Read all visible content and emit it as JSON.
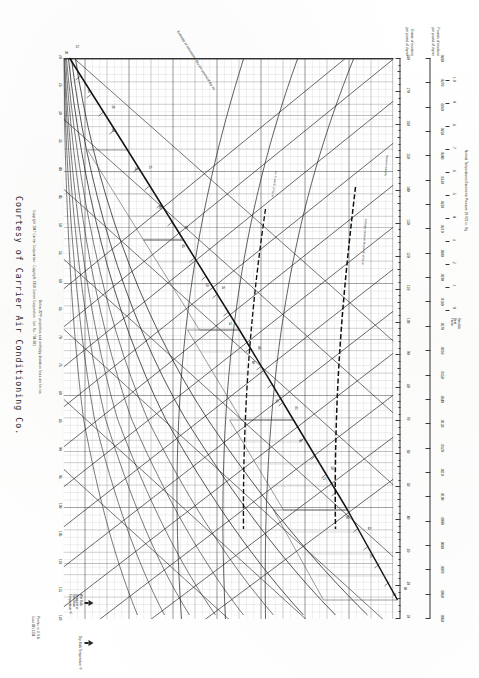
{
  "document": {
    "type": "psychrometric-chart",
    "title": "Psychrometric Chart",
    "courtesy": "Courtesy of Carrier Air Conditioning Co.",
    "copyright": "Copyright 1947 Carrier Corporation · Copyright 1959 Carrier Corporation · Cat. No. 794-001",
    "printed_in": "Printed in U.S.A.",
    "code": "Code 891 1234",
    "note_below_freezing": "Below 32°F properties and enthalpy deviation lines are for ice.",
    "barometric_note": "Normal Temperatures  Barometric Pressure 29.921 in. Hg"
  },
  "axes": {
    "pounds_moisture": {
      "caption_line1": "Pounds of moisture",
      "caption_line2": "per pound of dry air",
      "ticks": [
        ".0050",
        ".0060",
        ".0070",
        ".0080",
        ".0090",
        ".0100",
        ".0110",
        ".0120",
        ".0130",
        ".0140",
        ".0150",
        ".0160",
        ".0170",
        ".0180",
        ".0190",
        ".0200",
        ".0210",
        ".0220",
        ".0230",
        ".0240",
        ".0250",
        ".0260",
        ".0270",
        ".0280"
      ]
    },
    "grains_moisture": {
      "caption_line1": "Grains of moisture",
      "caption_line2": "per pound of dry air",
      "ticks": [
        "180",
        "170",
        "160",
        "150",
        "140",
        "130",
        "120",
        "110",
        "100",
        "90",
        "80",
        "70",
        "60",
        "50",
        "40",
        "30",
        "20",
        "10"
      ]
    },
    "enthalpy": {
      "caption": "Enthalpy at saturation - Btu per pound of dry air",
      "ticks": [
        "15",
        "20",
        "25",
        "30",
        "35",
        "40",
        "45",
        "50",
        "55",
        "60"
      ]
    },
    "dry_bulb": {
      "caption": "Dry Bulb Temperature °F",
      "ticks": [
        "20",
        "25",
        "30",
        "35",
        "40",
        "45",
        "50",
        "55",
        "60",
        "65",
        "70",
        "75",
        "80",
        "85",
        "90",
        "95",
        "100",
        "105",
        "110",
        "115",
        "120"
      ]
    },
    "wet_bulb": {
      "caption_line1": "Wet Bulb,",
      "caption_line2": "Dewpoint or",
      "caption_line3": "Saturation",
      "caption_line4": "Temperature °F",
      "ticks": [
        "20",
        "25",
        "30",
        "35",
        "40",
        "45",
        "50",
        "55",
        "60",
        "65",
        "70",
        "75",
        "80",
        "85",
        "90"
      ]
    },
    "relative_humidity": {
      "caption": "Relative Humidity",
      "curves": [
        "10%",
        "20%",
        "30%",
        "40%",
        "50%",
        "60%",
        "70%",
        "80%",
        "90%"
      ]
    },
    "volume": {
      "caption": "Cu. ft. per lb. of dry air",
      "ticks": [
        "12.5",
        "13.0",
        "13.5",
        "14.0",
        "14.5"
      ]
    },
    "sensible_heat_factor": {
      "caption_line1": "Sensible",
      "caption_line2": "Heat",
      "caption_line3": "Factor",
      "ticks": [
        "1.0",
        ".9",
        ".8",
        ".7",
        ".6",
        ".5",
        ".4",
        ".3",
        ".2",
        ".1",
        "0"
      ]
    },
    "enthalpy_deviation": {
      "caption": "Enthalpy deviation Btu per lb. of dry air",
      "ticks": [
        "-.1",
        "-.2",
        "-.3",
        "-.4",
        "-.5",
        "0",
        ".1",
        ".2",
        ".3"
      ]
    }
  },
  "chart_data": {
    "type": "line",
    "xlabel": "Dry Bulb Temperature °F",
    "ylabel": "Grains of moisture per pound of dry air",
    "xlim": [
      20,
      120
    ],
    "ylim": [
      0,
      185
    ],
    "grid": true,
    "legend_position": "none",
    "x": [
      20,
      25,
      30,
      35,
      40,
      45,
      50,
      55,
      60,
      65,
      70,
      75,
      80,
      85,
      90,
      95,
      100,
      105,
      110,
      115,
      120
    ],
    "series": [
      {
        "name": "Saturation (100% RH)",
        "values": [
          15,
          19,
          24,
          31,
          37,
          45,
          54,
          64,
          77,
          92,
          110,
          132,
          156,
          185,
          220,
          260,
          308,
          364,
          430,
          506,
          596
        ]
      },
      {
        "name": "90% RH",
        "values": [
          13,
          17,
          22,
          28,
          34,
          41,
          49,
          58,
          69,
          83,
          99,
          119,
          141,
          166,
          198,
          234,
          277,
          328,
          387,
          455,
          536
        ]
      },
      {
        "name": "80% RH",
        "values": [
          12,
          15,
          19,
          25,
          30,
          36,
          43,
          51,
          62,
          74,
          88,
          105,
          125,
          148,
          176,
          208,
          246,
          291,
          344,
          405,
          477
        ]
      },
      {
        "name": "70% RH",
        "values": [
          10,
          13,
          17,
          22,
          26,
          32,
          38,
          45,
          54,
          64,
          77,
          92,
          109,
          129,
          154,
          182,
          216,
          255,
          301,
          354,
          417
        ]
      },
      {
        "name": "60% RH",
        "values": [
          9,
          11,
          14,
          19,
          22,
          27,
          32,
          38,
          46,
          55,
          66,
          79,
          94,
          111,
          132,
          156,
          185,
          218,
          258,
          304,
          358
        ]
      },
      {
        "name": "50% RH",
        "values": [
          7,
          9,
          12,
          15,
          19,
          23,
          27,
          32,
          38,
          46,
          55,
          66,
          78,
          92,
          110,
          130,
          154,
          182,
          215,
          253,
          298
        ]
      },
      {
        "name": "40% RH",
        "values": [
          6,
          8,
          10,
          12,
          15,
          18,
          22,
          26,
          31,
          37,
          44,
          53,
          62,
          74,
          88,
          104,
          123,
          146,
          172,
          202,
          238
        ]
      },
      {
        "name": "30% RH",
        "values": [
          4,
          6,
          7,
          9,
          11,
          14,
          16,
          19,
          23,
          28,
          33,
          40,
          47,
          55,
          66,
          78,
          92,
          109,
          129,
          152,
          179
        ]
      },
      {
        "name": "20% RH",
        "values": [
          3,
          4,
          5,
          6,
          7,
          9,
          11,
          13,
          15,
          18,
          22,
          26,
          31,
          37,
          44,
          52,
          62,
          73,
          86,
          101,
          119
        ]
      },
      {
        "name": "10% RH",
        "values": [
          1,
          2,
          2,
          3,
          4,
          5,
          5,
          6,
          8,
          9,
          11,
          13,
          16,
          18,
          22,
          26,
          31,
          36,
          43,
          51,
          60
        ]
      }
    ],
    "wet_bulb_lines_degF": [
      20,
      25,
      30,
      35,
      40,
      45,
      50,
      55,
      60,
      65,
      70,
      75,
      80,
      85,
      90
    ],
    "enthalpy_lines_btu": [
      15,
      20,
      25,
      30,
      35,
      40,
      45,
      50,
      55,
      60
    ],
    "specific_volume_lines": [
      12.5,
      13.0,
      13.5,
      14.0,
      14.5
    ],
    "annotations": [
      "Relative Humidity",
      "Enthalpy deviation Btu per lb. of dry air",
      "Cu. ft. per lb. of dry air"
    ]
  }
}
